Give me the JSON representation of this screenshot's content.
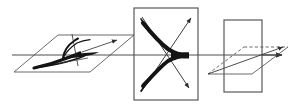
{
  "figure": {
    "title": "Evolution of a cusp caustic across three transverse planes",
    "width": 297,
    "height": 110,
    "background_color": "#ffffff",
    "line_color": "#3a3a3a",
    "caustic_color": "#111111",
    "frame_color": "#4a4a4a"
  },
  "axis": {
    "label": "optical-axis",
    "x_start": 12,
    "x_end": 288,
    "y": 55,
    "arrowhead": "right",
    "stroke_width": 0.9
  },
  "panels": [
    {
      "id": "panel-left",
      "label": "tilted plane with cusp caustic",
      "shape": "parallelogram",
      "points": "14,72 58,35 134,35 90,72",
      "content": "cusp-caustic-swallowtail",
      "has_arrow": true,
      "arrow_label": "ray-arrow-right-up"
    },
    {
      "id": "panel-middle",
      "label": "screen plane with X crossing and cusp",
      "shape": "rectangle",
      "x": 134,
      "y": 8,
      "width": 64,
      "height": 92,
      "content": "cusp-caustic-with-crossing-rays",
      "diagonals": [
        {
          "name": "diagonal-upleft-to-downright",
          "from": "142,18",
          "to": "190,90",
          "arrowhead": "end"
        },
        {
          "name": "diagonal-downleft-to-upright",
          "from": "142,92",
          "to": "192,16",
          "arrowhead": "end"
        }
      ]
    },
    {
      "id": "panel-right",
      "label": "plane beyond focus, no caustic",
      "shape": "rectangle",
      "x": 224,
      "y": 20,
      "width": 38,
      "height": 72,
      "content": "plain-plane-no-caustic",
      "parallelogram_points": "208,74 244,47 288,47 252,74",
      "has_arrow": true,
      "arrow_label": "ray-arrow-right-up"
    }
  ],
  "annotations": {
    "caustic_cusp": "cusp point of caustic",
    "crossing_rays": "two crossing ray bundles",
    "focus_direction": "propagation to the right"
  }
}
